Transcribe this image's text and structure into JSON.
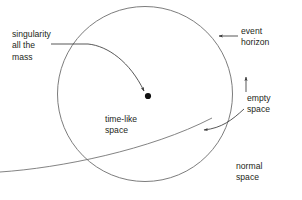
{
  "diagram": {
    "background_color": "#ffffff",
    "stroke_color": "#3a3a3a",
    "text_color": "#231f20",
    "shapes": {
      "event_horizon_circle": {
        "name": "event-horizon-circle",
        "center_x": 145,
        "center_y": 94,
        "radius": 87.5
      },
      "singularity_point": {
        "name": "singularity-dot",
        "x": 148,
        "y": 96,
        "radius": 3.1
      }
    },
    "labels": {
      "singularity": "singularity\nall the\nmass",
      "event_horizon": "event\nhorizon",
      "empty_space": "empty\nspace",
      "normal_space": "normal\nspace",
      "timelike_space": "time-like\nspace"
    },
    "leaders": {
      "singularity_leader": "curved-arrow-to-singularity-dot",
      "event_horizon_leader": "straight-arrow-to-circle-edge",
      "empty_space_leader": "curved-arrow-into-circle",
      "empty_space_tick": "vertical-tick-to-empty-region"
    }
  }
}
